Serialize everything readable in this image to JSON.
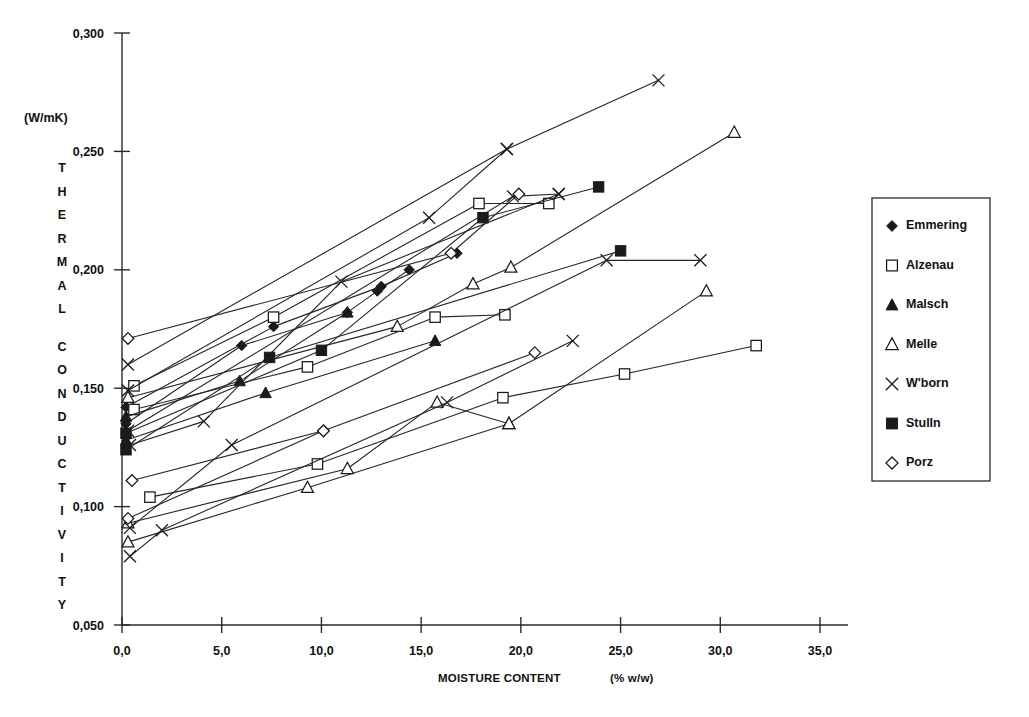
{
  "chart_data": {
    "type": "line",
    "title": "",
    "xlabel": "MOISTURE CONTENT",
    "xunit": "(%  w/w)",
    "ylabel": "THERMAL CONDUCTIVITY",
    "yunit": "(W/mK)",
    "xlim": [
      0.0,
      35.0
    ],
    "ylim": [
      0.05,
      0.3
    ],
    "xticks": [
      "0,0",
      "5,0",
      "10,0",
      "15,0",
      "20,0",
      "25,0",
      "30,0",
      "35,0"
    ],
    "xtick_values": [
      0.0,
      5.0,
      10.0,
      15.0,
      20.0,
      25.0,
      30.0,
      35.0
    ],
    "yticks": [
      "0,050",
      "0,100",
      "0,150",
      "0,200",
      "0,250",
      "0,300"
    ],
    "ytick_values": [
      0.05,
      0.1,
      0.15,
      0.2,
      0.25,
      0.3
    ],
    "grid": false,
    "legend_position": "right",
    "series": [
      {
        "name": "Emmering",
        "marker": "filled-diamond",
        "points": [
          {
            "x": 0.2,
            "y": 0.135
          },
          {
            "x": 6.0,
            "y": 0.168
          },
          {
            "x": 11.3,
            "y": 0.182
          },
          {
            "x": 12.8,
            "y": 0.191
          },
          {
            "x": 14.4,
            "y": 0.2
          }
        ]
      },
      {
        "name": "Emmering",
        "marker": "filled-diamond",
        "points": [
          {
            "x": 0.2,
            "y": 0.142
          },
          {
            "x": 7.6,
            "y": 0.176
          },
          {
            "x": 13.0,
            "y": 0.193
          },
          {
            "x": 16.8,
            "y": 0.207
          }
        ]
      },
      {
        "name": "Alzenau",
        "marker": "open-square",
        "points": [
          {
            "x": 0.6,
            "y": 0.151
          },
          {
            "x": 7.6,
            "y": 0.18
          },
          {
            "x": 17.9,
            "y": 0.228
          },
          {
            "x": 21.4,
            "y": 0.228
          }
        ]
      },
      {
        "name": "Alzenau",
        "marker": "open-square",
        "points": [
          {
            "x": 0.6,
            "y": 0.141
          },
          {
            "x": 9.3,
            "y": 0.159
          },
          {
            "x": 15.7,
            "y": 0.18
          },
          {
            "x": 19.2,
            "y": 0.181
          }
        ]
      },
      {
        "name": "Alzenau",
        "marker": "open-square",
        "points": [
          {
            "x": 1.4,
            "y": 0.104
          },
          {
            "x": 9.8,
            "y": 0.118
          },
          {
            "x": 19.1,
            "y": 0.146
          },
          {
            "x": 25.2,
            "y": 0.156
          },
          {
            "x": 31.8,
            "y": 0.168
          }
        ]
      },
      {
        "name": "Malsch",
        "marker": "filled-triangle",
        "points": [
          {
            "x": 0.2,
            "y": 0.138
          },
          {
            "x": 5.9,
            "y": 0.153
          },
          {
            "x": 11.3,
            "y": 0.182
          }
        ]
      },
      {
        "name": "Malsch",
        "marker": "filled-triangle",
        "points": [
          {
            "x": 0.2,
            "y": 0.128
          },
          {
            "x": 7.2,
            "y": 0.148
          },
          {
            "x": 15.7,
            "y": 0.17
          }
        ]
      },
      {
        "name": "Melle",
        "marker": "open-triangle",
        "points": [
          {
            "x": 0.3,
            "y": 0.146
          },
          {
            "x": 13.8,
            "y": 0.176
          },
          {
            "x": 17.6,
            "y": 0.194
          },
          {
            "x": 19.5,
            "y": 0.201
          },
          {
            "x": 30.7,
            "y": 0.258
          }
        ]
      },
      {
        "name": "Melle",
        "marker": "open-triangle",
        "points": [
          {
            "x": 0.3,
            "y": 0.093
          },
          {
            "x": 11.3,
            "y": 0.116
          },
          {
            "x": 15.8,
            "y": 0.144
          },
          {
            "x": 19.4,
            "y": 0.135
          },
          {
            "x": 29.3,
            "y": 0.191
          }
        ]
      },
      {
        "name": "Melle",
        "marker": "open-triangle",
        "points": [
          {
            "x": 0.3,
            "y": 0.085
          },
          {
            "x": 9.3,
            "y": 0.108
          },
          {
            "x": 19.4,
            "y": 0.135
          }
        ]
      },
      {
        "name": "W'born",
        "marker": "cross",
        "points": [
          {
            "x": 0.3,
            "y": 0.16
          },
          {
            "x": 19.3,
            "y": 0.251
          },
          {
            "x": 26.9,
            "y": 0.28
          }
        ]
      },
      {
        "name": "W'born",
        "marker": "cross",
        "points": [
          {
            "x": 0.3,
            "y": 0.149
          },
          {
            "x": 15.4,
            "y": 0.222
          },
          {
            "x": 19.3,
            "y": 0.251
          }
        ]
      },
      {
        "name": "W'born",
        "marker": "cross",
        "points": [
          {
            "x": 0.3,
            "y": 0.132
          },
          {
            "x": 19.6,
            "y": 0.231
          },
          {
            "x": 21.9,
            "y": 0.232
          }
        ]
      },
      {
        "name": "W'born",
        "marker": "cross",
        "points": [
          {
            "x": 0.4,
            "y": 0.126
          },
          {
            "x": 4.1,
            "y": 0.136
          },
          {
            "x": 11.0,
            "y": 0.195
          },
          {
            "x": 21.9,
            "y": 0.232
          }
        ]
      },
      {
        "name": "W'born",
        "marker": "cross",
        "points": [
          {
            "x": 0.4,
            "y": 0.091
          },
          {
            "x": 5.5,
            "y": 0.126
          },
          {
            "x": 24.3,
            "y": 0.204
          },
          {
            "x": 29.0,
            "y": 0.204
          }
        ]
      },
      {
        "name": "W'born",
        "marker": "cross",
        "points": [
          {
            "x": 0.4,
            "y": 0.079
          },
          {
            "x": 2.0,
            "y": 0.09
          },
          {
            "x": 16.3,
            "y": 0.144
          },
          {
            "x": 22.6,
            "y": 0.17
          }
        ]
      },
      {
        "name": "Stulln",
        "marker": "filled-square",
        "points": [
          {
            "x": 0.2,
            "y": 0.131
          },
          {
            "x": 10.0,
            "y": 0.166
          },
          {
            "x": 18.1,
            "y": 0.222
          },
          {
            "x": 23.9,
            "y": 0.235
          }
        ]
      },
      {
        "name": "Stulln",
        "marker": "filled-square",
        "points": [
          {
            "x": 0.2,
            "y": 0.124
          },
          {
            "x": 7.4,
            "y": 0.163
          },
          {
            "x": 25.0,
            "y": 0.208
          }
        ]
      },
      {
        "name": "Porz",
        "marker": "open-diamond",
        "points": [
          {
            "x": 0.3,
            "y": 0.171
          },
          {
            "x": 16.5,
            "y": 0.207
          },
          {
            "x": 19.9,
            "y": 0.232
          }
        ]
      },
      {
        "name": "Porz",
        "marker": "open-diamond",
        "points": [
          {
            "x": 0.3,
            "y": 0.095
          },
          {
            "x": 10.1,
            "y": 0.132
          },
          {
            "x": 20.7,
            "y": 0.165
          }
        ]
      },
      {
        "name": "Porz",
        "marker": "open-diamond",
        "points": [
          {
            "x": 0.5,
            "y": 0.111
          },
          {
            "x": 10.1,
            "y": 0.132
          }
        ]
      }
    ]
  },
  "legend": {
    "items": [
      {
        "label": "Emmering",
        "marker": "filled-diamond"
      },
      {
        "label": "Alzenau",
        "marker": "open-square"
      },
      {
        "label": "Malsch",
        "marker": "filled-triangle"
      },
      {
        "label": "Melle",
        "marker": "open-triangle"
      },
      {
        "label": "W'born",
        "marker": "cross"
      },
      {
        "label": "Stulln",
        "marker": "filled-square"
      },
      {
        "label": "Porz",
        "marker": "open-diamond"
      }
    ]
  },
  "colors": {
    "ink": "#1a1a1a",
    "axis": "#2a2a2a",
    "background": "#ffffff"
  }
}
